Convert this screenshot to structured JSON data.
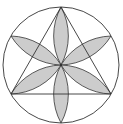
{
  "diagram": {
    "colors": {
      "stroke": "#333333",
      "petal_fill": "#cccccc",
      "background": "#ffffff"
    },
    "circle": {
      "cx": 61,
      "cy": 65,
      "r": 58
    },
    "triangle": [
      [
        61,
        7
      ],
      [
        11,
        94
      ],
      [
        111,
        94
      ]
    ],
    "petal_tips": [
      [
        61,
        7
      ],
      [
        111,
        36
      ],
      [
        111,
        94
      ],
      [
        61,
        123
      ],
      [
        11,
        94
      ],
      [
        11,
        36
      ]
    ],
    "petal_count": 6
  }
}
